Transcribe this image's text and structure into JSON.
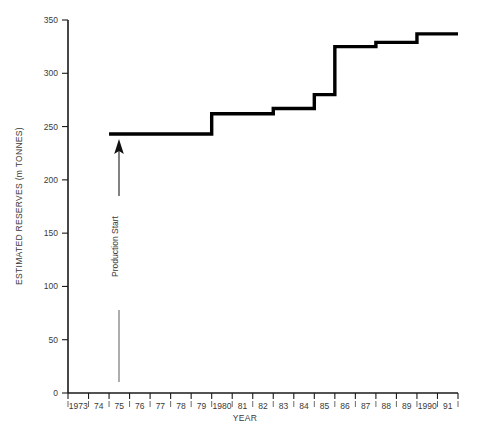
{
  "chart_data": {
    "type": "line",
    "subtype": "step",
    "title": "",
    "xlabel": "YEAR",
    "ylabel": "ESTIMATED RESERVES (m TONNES)",
    "xlim": [
      1973,
      1992
    ],
    "ylim": [
      0,
      350
    ],
    "grid": false,
    "legend": "none",
    "x_tick_labels": [
      "1973",
      "74",
      "75",
      "76",
      "77",
      "78",
      "79",
      "1980",
      "81",
      "82",
      "83",
      "84",
      "85",
      "86",
      "87",
      "88",
      "89",
      "1990",
      "91"
    ],
    "x_tick_values": [
      1973,
      1974,
      1975,
      1976,
      1977,
      1978,
      1979,
      1980,
      1981,
      1982,
      1983,
      1984,
      1985,
      1986,
      1987,
      1988,
      1989,
      1990,
      1991
    ],
    "y_tick_labels": [
      "0",
      "50",
      "100",
      "150",
      "200",
      "250",
      "300",
      "350"
    ],
    "y_tick_values": [
      0,
      50,
      100,
      150,
      200,
      250,
      300,
      350
    ],
    "series": [
      {
        "name": "Estimated Reserves",
        "color": "#000000",
        "x": [
          1975,
          1980,
          1983,
          1985,
          1986,
          1988,
          1990,
          1992
        ],
        "values": [
          243,
          262,
          267,
          280,
          325,
          329,
          337,
          337
        ],
        "points": [
          {
            "year": 1975,
            "value": 243
          },
          {
            "year": 1980,
            "value": 262
          },
          {
            "year": 1983,
            "value": 267
          },
          {
            "year": 1985,
            "value": 280
          },
          {
            "year": 1986,
            "value": 325
          },
          {
            "year": 1988,
            "value": 329
          },
          {
            "year": 1990,
            "value": 337
          }
        ]
      }
    ],
    "annotations": [
      {
        "text": "Production Start",
        "x": 1975.35,
        "y_from": 0,
        "y_to": 240,
        "style": "vertical-arrow-up"
      }
    ]
  },
  "axes": {
    "y_axis_title": "ESTIMATED RESERVES (m TONNES)",
    "x_axis_title": "YEAR"
  },
  "annotation": {
    "production_start_label": "Production Start"
  }
}
